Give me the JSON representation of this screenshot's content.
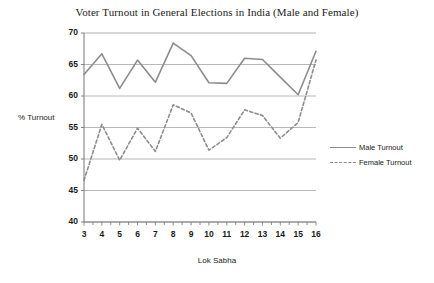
{
  "chart_data": {
    "type": "line",
    "title": "Voter Turnout in General Elections in India (Male and Female)",
    "xlabel": "Lok Sabha",
    "ylabel": "% Turnout",
    "categories": [
      "3",
      "4",
      "5",
      "6",
      "7",
      "8",
      "9",
      "10",
      "11",
      "12",
      "13",
      "14",
      "15",
      "16"
    ],
    "x": [
      3,
      4,
      5,
      6,
      7,
      8,
      9,
      10,
      11,
      12,
      13,
      14,
      15,
      16
    ],
    "ylim": [
      40,
      70
    ],
    "yticks": [
      40,
      45,
      50,
      55,
      60,
      65,
      70
    ],
    "xlim": [
      3,
      16
    ],
    "grid": "horizontal",
    "legend_position": "right",
    "series": [
      {
        "name": "Male Turnout",
        "style": "solid",
        "color": "#8c8c8c",
        "values": [
          63.4,
          66.7,
          61.2,
          65.7,
          62.2,
          68.4,
          66.4,
          62.1,
          62.0,
          66.0,
          65.8,
          63.0,
          60.2,
          67.1
        ]
      },
      {
        "name": "Female Turnout",
        "style": "dashed",
        "color": "#8c8c8c",
        "values": [
          46.6,
          55.5,
          49.8,
          54.9,
          51.2,
          58.6,
          57.3,
          51.4,
          53.4,
          57.8,
          56.9,
          53.3,
          55.8,
          65.7
        ]
      }
    ]
  },
  "legend": {
    "male_label": "Male Turnout",
    "female_label": "Female Turnout"
  },
  "colors": {
    "line": "#8c8c8c",
    "grid": "#a6a6a6",
    "axis": "#808080",
    "text": "#1a1a1a"
  }
}
